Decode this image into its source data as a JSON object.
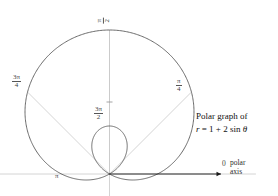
{
  "figure": {
    "type": "polar-graph",
    "background": "#ffffff",
    "curve_color": "#5a5a5a",
    "axis_color": "#c9c9c9",
    "arrow_color": "#1a1a1a",
    "label_color": "#444444"
  },
  "caption": {
    "line1": "Polar graph of",
    "equation_r": "r",
    "equation_rest": " = 1 + 2 sin ",
    "equation_theta": "θ"
  },
  "axis_labels": {
    "pi_over_2_num": "π",
    "pi_over_2_den": "2",
    "three_pi_over_4_num": "3π",
    "three_pi_over_4_den": "4",
    "pi_over_4_num": "π",
    "pi_over_4_den": "4",
    "three_pi_over_2_num": "3π",
    "three_pi_over_2_den": "2",
    "pi": "π",
    "zero": "0",
    "polar": "polar",
    "axis": "axis"
  },
  "chart_data": {
    "type": "line",
    "title": "Polar graph of r = 1 + 2 sin θ",
    "plot_kind": "polar",
    "equation": "r = 1 + 2 sin(theta)",
    "curve_name": "limacon-with-inner-loop",
    "a": 1,
    "b": 2,
    "xlabel": "polar axis",
    "ylabel": "",
    "grid": false,
    "legend": false,
    "orientation_note": "rendered with pole at bottom center; large lobe extends upward",
    "angle_ticks": [
      {
        "label": "0",
        "radians": 0,
        "direction_deg": 0
      },
      {
        "label": "π/4",
        "radians": 0.7854,
        "direction_deg": 45
      },
      {
        "label": "π/2",
        "radians": 1.5708,
        "direction_deg": 90
      },
      {
        "label": "3π/4",
        "radians": 2.3562,
        "direction_deg": 135
      },
      {
        "label": "π",
        "radians": 3.1416,
        "direction_deg": 180
      },
      {
        "label": "3π/2",
        "radians": 4.7124,
        "direction_deg": 270
      }
    ],
    "r_max": 3,
    "r_min": -1,
    "inner_loop_theta_range": [
      3.6652,
      5.7596
    ],
    "key_points": [
      {
        "theta": 0,
        "r": 1
      },
      {
        "theta": 0.7854,
        "r": 2.414
      },
      {
        "theta": 1.5708,
        "r": 3
      },
      {
        "theta": 2.3562,
        "r": 2.414
      },
      {
        "theta": 3.1416,
        "r": 1
      },
      {
        "theta": 3.6652,
        "r": 0
      },
      {
        "theta": 4.7124,
        "r": -1
      },
      {
        "theta": 5.7596,
        "r": 0
      }
    ],
    "r_values_by_theta_deg": {
      "0": 1.0,
      "15": 1.518,
      "30": 2.0,
      "45": 2.414,
      "60": 2.732,
      "75": 2.932,
      "90": 3.0,
      "105": 2.932,
      "120": 2.732,
      "135": 2.414,
      "150": 2.0,
      "165": 1.518,
      "180": 1.0,
      "195": 0.482,
      "210": 0.0,
      "225": -0.414,
      "240": -0.732,
      "255": -0.932,
      "270": -1.0,
      "285": -0.932,
      "300": -0.732,
      "315": -0.414,
      "330": 0.0,
      "345": 0.482,
      "360": 1.0
    }
  }
}
